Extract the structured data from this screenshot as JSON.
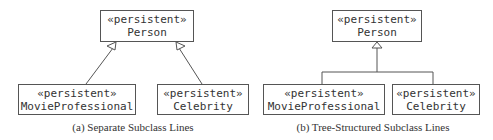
{
  "diagrams": [
    {
      "id": "a",
      "caption": "(a) Separate Subclass Lines",
      "superclass": {
        "stereotype": "«persistent»",
        "name": "Person"
      },
      "subclasses": [
        {
          "stereotype": "«persistent»",
          "name": "MovieProfessional"
        },
        {
          "stereotype": "«persistent»",
          "name": "Celebrity"
        }
      ],
      "style": "separate-lines"
    },
    {
      "id": "b",
      "caption": "(b) Tree-Structured Subclass Lines",
      "superclass": {
        "stereotype": "«persistent»",
        "name": "Person"
      },
      "subclasses": [
        {
          "stereotype": "«persistent»",
          "name": "MovieProfessional"
        },
        {
          "stereotype": "«persistent»",
          "name": "Celebrity"
        }
      ],
      "style": "tree-structured"
    }
  ]
}
